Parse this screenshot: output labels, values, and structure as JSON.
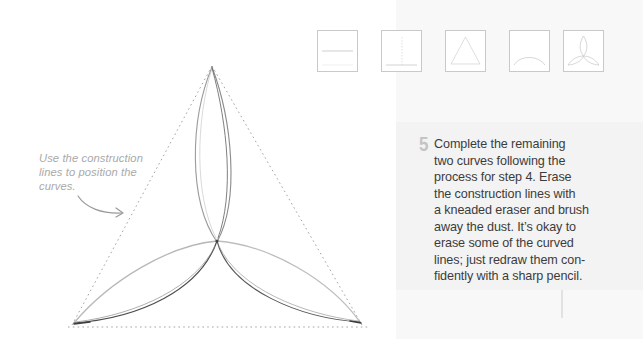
{
  "annotation": {
    "lines": [
      "Use the construction",
      "lines to position the",
      "curves."
    ],
    "arrow_icon": "curved-arrow-right"
  },
  "thumbnails": [
    {
      "step": 1,
      "depicts": "horizontal base line"
    },
    {
      "step": 2,
      "depicts": "vertical center line on base"
    },
    {
      "step": 3,
      "depicts": "equilateral triangle"
    },
    {
      "step": 4,
      "depicts": "first curve arc"
    },
    {
      "step": 5,
      "depicts": "completed three-petal triquetra"
    }
  ],
  "step": {
    "number": "5",
    "text_lines": [
      "Complete the remaining",
      "two curves following the",
      "process for step 4. Erase",
      "the construction lines with",
      "a kneaded eraser and brush",
      "away the dust. It’s okay to",
      "erase some of the curved",
      "lines; just redraw them con-",
      "fidently with a sharp pencil."
    ]
  },
  "colors": {
    "body_text": "#3c3c3c",
    "annotation_text": "#a9a9a9",
    "step_number": "#c4c4c4",
    "panel_bg": "#f8f8f8",
    "panel_band": "#f3f3f3",
    "pencil_dark": "#555555",
    "pencil_light": "#b5b5b5",
    "construction_line": "#9a9a9a"
  }
}
